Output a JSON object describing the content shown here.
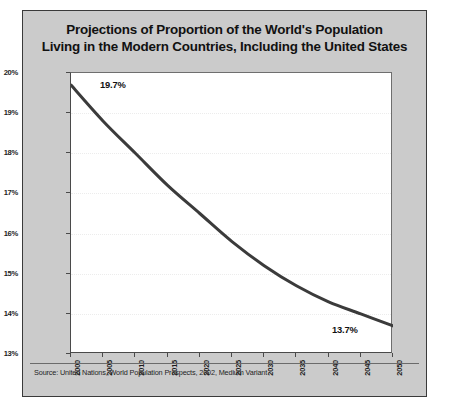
{
  "figure": {
    "title_line1": "Projections of Proportion of the World's Population",
    "title_line2": "Living in the Modern Countries, Including the United States",
    "source": "Source: United Nations, World Population Prospects, 2002, Medium Variant",
    "panel_color": "#cbcbcb",
    "plot_background": "#ffffff",
    "line_color": "#3b3b3b",
    "gridline_color": "#ececec"
  },
  "annotations": {
    "start_label": "19.7%",
    "end_label": "13.7%"
  },
  "chart_data": {
    "type": "line",
    "title": "Projections of Proportion of the World's Population Living in the Modern Countries, Including the United States",
    "xlabel": "",
    "ylabel": "",
    "x": [
      2000,
      2005,
      2010,
      2015,
      2020,
      2025,
      2030,
      2035,
      2040,
      2045,
      2050
    ],
    "values": [
      19.7,
      18.8,
      18.0,
      17.2,
      16.5,
      15.8,
      15.2,
      14.7,
      14.3,
      14.0,
      13.7
    ],
    "xtick_labels": [
      "2000",
      "2005",
      "2010",
      "2015",
      "2020",
      "2025",
      "2030",
      "2035",
      "2040",
      "2045",
      "2050"
    ],
    "ytick_labels": [
      "20%",
      "19%",
      "18%",
      "17%",
      "16%",
      "15%",
      "14%",
      "13%"
    ],
    "ytick_values": [
      20,
      19,
      18,
      17,
      16,
      15,
      14,
      13
    ],
    "xlim": [
      2000,
      2050
    ],
    "ylim": [
      13,
      20
    ],
    "grid": true,
    "legend": "none",
    "data_labels": [
      "19.7%",
      "13.7%"
    ]
  }
}
